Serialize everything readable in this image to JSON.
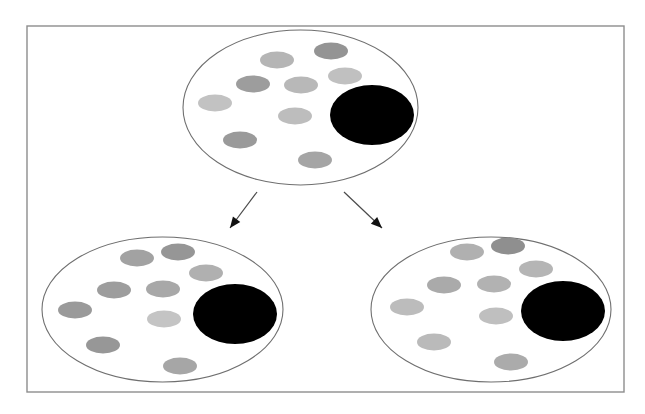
{
  "figure": {
    "background_color": "#ffffff",
    "frame": {
      "name": "outer-frame",
      "x": 27,
      "y": 26,
      "width": 597,
      "height": 366,
      "stroke_color": "#8d8d8d",
      "stroke_width": 1.4,
      "fill": "none"
    },
    "colors": {
      "outline": "#6f6f6f",
      "frame": "#8d8d8d",
      "large_dot": "#000000",
      "arrow": "#4a4a4a",
      "arrow_head": "#111111",
      "small_dot_light": "#c3c3c3",
      "small_dot_mid": "#a8a8a8",
      "small_dot_dark": "#8f8f8f"
    },
    "populations": [
      {
        "name": "parent-population",
        "label": "parent",
        "cx": 300.5,
        "cy": 107.5,
        "rx": 117.5,
        "ry": 77.5,
        "large_dot": {
          "name": "large-black-cell",
          "cx": 372,
          "cy": 115,
          "rx": 42,
          "ry": 30,
          "color": "#000000"
        },
        "small_dots": [
          {
            "cx": 277,
            "cy": 60,
            "rx": 17,
            "ry": 8.5,
            "color": "#b5b5b5"
          },
          {
            "cx": 331,
            "cy": 51,
            "rx": 17,
            "ry": 8.5,
            "color": "#949494"
          },
          {
            "cx": 345,
            "cy": 76,
            "rx": 17,
            "ry": 8.5,
            "color": "#c0c0c0"
          },
          {
            "cx": 253,
            "cy": 84,
            "rx": 17,
            "ry": 8.5,
            "color": "#9d9d9d"
          },
          {
            "cx": 301,
            "cy": 85,
            "rx": 17,
            "ry": 8.5,
            "color": "#b8b8b8"
          },
          {
            "cx": 215,
            "cy": 103,
            "rx": 17,
            "ry": 8.5,
            "color": "#c2c2c2"
          },
          {
            "cx": 295,
            "cy": 116,
            "rx": 17,
            "ry": 8.5,
            "color": "#bdbdbd"
          },
          {
            "cx": 240,
            "cy": 140,
            "rx": 17,
            "ry": 8.5,
            "color": "#9a9a9a"
          },
          {
            "cx": 315,
            "cy": 160,
            "rx": 17,
            "ry": 8.5,
            "color": "#a5a5a5"
          }
        ]
      },
      {
        "name": "daughter-population-left",
        "label": "daughter left",
        "cx": 162.5,
        "cy": 309.5,
        "rx": 120.5,
        "ry": 72.5,
        "large_dot": {
          "name": "large-black-cell",
          "cx": 235,
          "cy": 314,
          "rx": 42,
          "ry": 30,
          "color": "#000000"
        },
        "small_dots": [
          {
            "cx": 137,
            "cy": 258,
            "rx": 17,
            "ry": 8.5,
            "color": "#a2a2a2"
          },
          {
            "cx": 178,
            "cy": 252,
            "rx": 17,
            "ry": 8.5,
            "color": "#969696"
          },
          {
            "cx": 206,
            "cy": 273,
            "rx": 17,
            "ry": 8.5,
            "color": "#b0b0b0"
          },
          {
            "cx": 114,
            "cy": 290,
            "rx": 17,
            "ry": 8.5,
            "color": "#9d9d9d"
          },
          {
            "cx": 163,
            "cy": 289,
            "rx": 17,
            "ry": 8.5,
            "color": "#a8a8a8"
          },
          {
            "cx": 75,
            "cy": 310,
            "rx": 17,
            "ry": 8.5,
            "color": "#9a9a9a"
          },
          {
            "cx": 164,
            "cy": 319,
            "rx": 17,
            "ry": 8.5,
            "color": "#c4c4c4"
          },
          {
            "cx": 103,
            "cy": 345,
            "rx": 17,
            "ry": 8.5,
            "color": "#979797"
          },
          {
            "cx": 180,
            "cy": 366,
            "rx": 17,
            "ry": 8.5,
            "color": "#a6a6a6"
          }
        ]
      },
      {
        "name": "daughter-population-right",
        "label": "daughter right",
        "cx": 491,
        "cy": 309.5,
        "rx": 120,
        "ry": 72.5,
        "large_dot": {
          "name": "large-black-cell",
          "cx": 563,
          "cy": 311,
          "rx": 42,
          "ry": 30,
          "color": "#000000"
        },
        "small_dots": [
          {
            "cx": 467,
            "cy": 252,
            "rx": 17,
            "ry": 8.5,
            "color": "#b0b0b0"
          },
          {
            "cx": 508,
            "cy": 246,
            "rx": 17,
            "ry": 8.5,
            "color": "#8f8f8f"
          },
          {
            "cx": 536,
            "cy": 269,
            "rx": 17,
            "ry": 8.5,
            "color": "#b5b5b5"
          },
          {
            "cx": 444,
            "cy": 285,
            "rx": 17,
            "ry": 8.5,
            "color": "#aaaaaa"
          },
          {
            "cx": 494,
            "cy": 284,
            "rx": 17,
            "ry": 8.5,
            "color": "#b2b2b2"
          },
          {
            "cx": 407,
            "cy": 307,
            "rx": 17,
            "ry": 8.5,
            "color": "#bcbcbc"
          },
          {
            "cx": 496,
            "cy": 316,
            "rx": 17,
            "ry": 8.5,
            "color": "#bfbfbf"
          },
          {
            "cx": 434,
            "cy": 342,
            "rx": 17,
            "ry": 8.5,
            "color": "#bababa"
          },
          {
            "cx": 511,
            "cy": 362,
            "rx": 17,
            "ry": 8.5,
            "color": "#ababab"
          }
        ]
      }
    ],
    "arrows": [
      {
        "name": "arrow-to-left-daughter",
        "x1": 257,
        "y1": 192,
        "x2": 230,
        "y2": 228,
        "head_angle_deg": 127,
        "color": "#4a4a4a"
      },
      {
        "name": "arrow-to-right-daughter",
        "x1": 344,
        "y1": 192,
        "x2": 382,
        "y2": 228,
        "head_angle_deg": 43,
        "color": "#4a4a4a"
      }
    ]
  }
}
